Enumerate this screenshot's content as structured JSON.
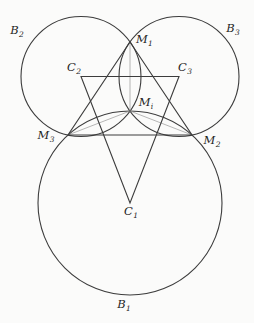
{
  "figure": {
    "canvas": {
      "width": 254,
      "height": 323,
      "background": "#fbfbfa"
    },
    "style": {
      "stroke_main": "#3c3c3c",
      "stroke_thin": "#8f8f8f",
      "label_color": "#1f1f1f",
      "stroke_width_main": 1.1,
      "stroke_width_thin": 0.65,
      "label_font_size": 11.5,
      "label_sub_font_size": 7.5
    },
    "circles": [
      {
        "name": "B1",
        "cx": 130,
        "cy": 203,
        "r": 92
      },
      {
        "name": "B2",
        "cx": 81,
        "cy": 76.5,
        "r": 60
      },
      {
        "name": "B3",
        "cx": 179,
        "cy": 76.5,
        "r": 60
      }
    ],
    "polygons": [
      {
        "name": "triangle-M1M2M3",
        "points": "130,42 192,135 68,135"
      },
      {
        "name": "triangle-C2C3C1",
        "points": "81,76.5 179,76.5 130,203"
      }
    ],
    "segments": [
      {
        "name": "chord-M1-Mi",
        "x1": 130,
        "y1": 42,
        "x2": 130,
        "y2": 111
      },
      {
        "name": "chord-M3-Mi",
        "x1": 68,
        "y1": 135,
        "x2": 130,
        "y2": 111
      },
      {
        "name": "chord-M2-Mi",
        "x1": 192,
        "y1": 135,
        "x2": 130,
        "y2": 111
      }
    ],
    "labels": [
      {
        "name": "B2",
        "main": "B",
        "sub": "2",
        "x": 17,
        "y": 34,
        "anchor": "middle"
      },
      {
        "name": "B3",
        "main": "B",
        "sub": "3",
        "x": 233,
        "y": 32,
        "anchor": "middle"
      },
      {
        "name": "M1",
        "main": "M",
        "sub": "1",
        "x": 136,
        "y": 43,
        "anchor": "start"
      },
      {
        "name": "C2",
        "main": "C",
        "sub": "2",
        "x": 74,
        "y": 71,
        "anchor": "middle"
      },
      {
        "name": "C3",
        "main": "C",
        "sub": "3",
        "x": 185,
        "y": 71,
        "anchor": "middle"
      },
      {
        "name": "Mi",
        "main": "M",
        "sub": "i",
        "x": 146,
        "y": 106,
        "anchor": "middle"
      },
      {
        "name": "M3",
        "main": "M",
        "sub": "3",
        "x": 46,
        "y": 139,
        "anchor": "middle"
      },
      {
        "name": "M2",
        "main": "M",
        "sub": "2",
        "x": 212,
        "y": 144,
        "anchor": "middle"
      },
      {
        "name": "C1",
        "main": "C",
        "sub": "1",
        "x": 131,
        "y": 215,
        "anchor": "middle"
      },
      {
        "name": "B1",
        "main": "B",
        "sub": "1",
        "x": 124,
        "y": 308,
        "anchor": "middle"
      }
    ]
  }
}
